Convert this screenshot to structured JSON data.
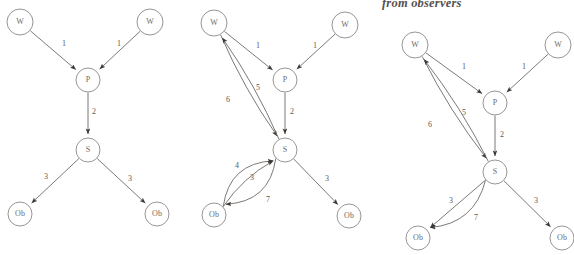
{
  "caption": {
    "text": "from observers"
  },
  "colors": {
    "background": "#ffffff",
    "node_stroke": "#8d8986",
    "node_fill": "#ffffff",
    "edge_stroke": "#6e6a67",
    "label_text": "#5c5856",
    "caption_text": "#55504e"
  },
  "diagrams": [
    {
      "id": "diagram-left",
      "nodes": [
        {
          "id": "w1",
          "label": "W",
          "x": 20,
          "y": 22,
          "r": 13
        },
        {
          "id": "w2",
          "label": "W",
          "x": 150,
          "y": 22,
          "r": 13
        },
        {
          "id": "p",
          "label": "P",
          "x": 88,
          "y": 80,
          "r": 12
        },
        {
          "id": "s",
          "label": "S",
          "x": 88,
          "y": 150,
          "r": 12
        },
        {
          "id": "ob1",
          "label": "Ob",
          "x": 20,
          "y": 214,
          "r": 12
        },
        {
          "id": "ob2",
          "label": "Ob",
          "x": 157,
          "y": 214,
          "r": 12
        }
      ],
      "edges": [
        {
          "from": "w1",
          "to": "p",
          "label": "1",
          "label_x": 64,
          "label_y": 44,
          "curve": 0
        },
        {
          "from": "w2",
          "to": "p",
          "label": "1",
          "label_x": 119,
          "label_y": 44,
          "curve": 0
        },
        {
          "from": "p",
          "to": "s",
          "label": "2",
          "label_x": 94,
          "label_y": 112,
          "curve": 0
        },
        {
          "from": "s",
          "to": "ob1",
          "label": "3",
          "label_x": 46,
          "label_y": 177,
          "curve": 0
        },
        {
          "from": "s",
          "to": "ob2",
          "label": "3",
          "label_x": 130,
          "label_y": 179,
          "curve": 0
        }
      ]
    },
    {
      "id": "diagram-middle",
      "nodes": [
        {
          "id": "w1",
          "label": "W",
          "x": 214,
          "y": 23,
          "r": 13
        },
        {
          "id": "w2",
          "label": "W",
          "x": 345,
          "y": 25,
          "r": 13
        },
        {
          "id": "p",
          "label": "P",
          "x": 285,
          "y": 80,
          "r": 12
        },
        {
          "id": "s",
          "label": "S",
          "x": 285,
          "y": 150,
          "r": 12
        },
        {
          "id": "ob1",
          "label": "Ob",
          "x": 214,
          "y": 215,
          "r": 12
        },
        {
          "id": "ob2",
          "label": "Ob",
          "x": 349,
          "y": 216,
          "r": 12
        }
      ],
      "edges": [
        {
          "from": "w1",
          "to": "p",
          "label": "1",
          "label_x": 258,
          "label_y": 46,
          "curve": 0
        },
        {
          "from": "w2",
          "to": "p",
          "label": "1",
          "label_x": 315,
          "label_y": 46,
          "curve": 0
        },
        {
          "from": "p",
          "to": "s",
          "label": "2",
          "label_x": 292,
          "label_y": 112,
          "curve": 0
        },
        {
          "from": "w1",
          "to": "s",
          "label": "5",
          "label_x": 258,
          "label_y": 88,
          "curve": 3
        },
        {
          "from": "s",
          "to": "w1",
          "label": "6",
          "label_x": 228,
          "label_y": 100,
          "curve": 3
        },
        {
          "from": "ob1",
          "to": "s",
          "label": "4",
          "label_x": 237,
          "label_y": 166,
          "curve": -14
        },
        {
          "from": "ob1",
          "to": "s",
          "label": "3",
          "label_x": 252,
          "label_y": 178,
          "curve": -4
        },
        {
          "from": "s",
          "to": "ob1",
          "label": "7",
          "label_x": 268,
          "label_y": 200,
          "curve": -14
        },
        {
          "from": "s",
          "to": "ob2",
          "label": "3",
          "label_x": 327,
          "label_y": 179,
          "curve": 0
        }
      ]
    },
    {
      "id": "diagram-right",
      "nodes": [
        {
          "id": "w1",
          "label": "W",
          "x": 415,
          "y": 45,
          "r": 13
        },
        {
          "id": "w2",
          "label": "W",
          "x": 558,
          "y": 45,
          "r": 13
        },
        {
          "id": "p",
          "label": "P",
          "x": 495,
          "y": 103,
          "r": 12
        },
        {
          "id": "s",
          "label": "S",
          "x": 495,
          "y": 172,
          "r": 12
        },
        {
          "id": "ob1",
          "label": "Ob",
          "x": 418,
          "y": 238,
          "r": 12
        },
        {
          "id": "ob2",
          "label": "Ob",
          "x": 562,
          "y": 238,
          "r": 12
        }
      ],
      "edges": [
        {
          "from": "w1",
          "to": "p",
          "label": "1",
          "label_x": 464,
          "label_y": 67,
          "curve": 0
        },
        {
          "from": "w2",
          "to": "p",
          "label": "1",
          "label_x": 524,
          "label_y": 67,
          "curve": 0
        },
        {
          "from": "p",
          "to": "s",
          "label": "2",
          "label_x": 502,
          "label_y": 135,
          "curve": 0
        },
        {
          "from": "w1",
          "to": "s",
          "label": "5",
          "label_x": 464,
          "label_y": 113,
          "curve": 3
        },
        {
          "from": "s",
          "to": "w1",
          "label": "6",
          "label_x": 430,
          "label_y": 125,
          "curve": 3
        },
        {
          "from": "s",
          "to": "ob1",
          "label": "3",
          "label_x": 451,
          "label_y": 201,
          "curve": 0
        },
        {
          "from": "s",
          "to": "ob1",
          "label": "7",
          "label_x": 476,
          "label_y": 218,
          "curve": -13
        },
        {
          "from": "s",
          "to": "ob2",
          "label": "3",
          "label_x": 536,
          "label_y": 201,
          "curve": 0
        }
      ]
    }
  ]
}
